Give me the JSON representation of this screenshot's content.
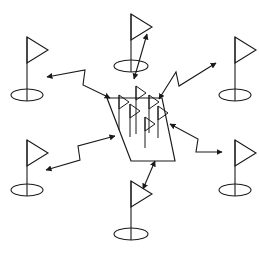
{
  "figure": {
    "title": "",
    "background_color": "#ffffff",
    "ink_color": "#1a1a1a",
    "width": 259,
    "height": 254
  },
  "central_region": {
    "name": "central-quadrilateral",
    "points": "107,98 162,98 175,161 131,161",
    "label": ""
  },
  "outer_flags": [
    {
      "id": "flag-top-left",
      "label": "",
      "pole_x": 27,
      "pole_top": 37,
      "pole_bottom": 101,
      "banner_w": 21,
      "banner_h": 13,
      "base_rx": 16,
      "base_ry": 6
    },
    {
      "id": "flag-top-center",
      "label": "",
      "pole_x": 131,
      "pole_top": 14,
      "pole_bottom": 72,
      "banner_w": 21,
      "banner_h": 13,
      "base_rx": 17,
      "base_ry": 6
    },
    {
      "id": "flag-top-right",
      "label": "",
      "pole_x": 235,
      "pole_top": 37,
      "pole_bottom": 101,
      "banner_w": 21,
      "banner_h": 13,
      "base_rx": 16,
      "base_ry": 6
    },
    {
      "id": "flag-bottom-left",
      "label": "",
      "pole_x": 27,
      "pole_top": 140,
      "pole_bottom": 196,
      "banner_w": 21,
      "banner_h": 13,
      "base_rx": 16,
      "base_ry": 6
    },
    {
      "id": "flag-bottom-center",
      "label": "",
      "pole_x": 131,
      "pole_top": 181,
      "pole_bottom": 240,
      "banner_w": 21,
      "banner_h": 13,
      "base_rx": 17,
      "base_ry": 6
    },
    {
      "id": "flag-bottom-right",
      "label": "",
      "pole_x": 235,
      "pole_top": 140,
      "pole_bottom": 196,
      "banner_w": 21,
      "banner_h": 13,
      "base_rx": 16,
      "base_ry": 6
    }
  ],
  "inner_flags": [
    {
      "id": "inner-flag-1",
      "pole_x": 119,
      "pole_top": 95,
      "pole_bottom": 130,
      "banner_w": 10,
      "banner_h": 7
    },
    {
      "id": "inner-flag-2",
      "pole_x": 136,
      "pole_top": 86,
      "pole_bottom": 134,
      "banner_w": 10,
      "banner_h": 7
    },
    {
      "id": "inner-flag-3",
      "pole_x": 130,
      "pole_top": 104,
      "pole_bottom": 137,
      "banner_w": 10,
      "banner_h": 7
    },
    {
      "id": "inner-flag-4",
      "pole_x": 149,
      "pole_top": 95,
      "pole_bottom": 133,
      "banner_w": 10,
      "banner_h": 7
    },
    {
      "id": "inner-flag-5",
      "pole_x": 145,
      "pole_top": 117,
      "pole_bottom": 148,
      "banner_w": 10,
      "banner_h": 7
    },
    {
      "id": "inner-flag-6",
      "pole_x": 158,
      "pole_top": 106,
      "pole_bottom": 138,
      "banner_w": 10,
      "banner_h": 7
    }
  ],
  "connectors": [
    {
      "id": "connector-top-left",
      "shape": "zigzag",
      "arrowheads": "both",
      "path": "47,77 85,70 83,85 110,98"
    },
    {
      "id": "connector-top-center",
      "shape": "straight",
      "arrowheads": "both",
      "path": "134,79 147,34"
    },
    {
      "id": "connector-top-right",
      "shape": "zigzag",
      "arrowheads": "both",
      "path": "159,99 176,72 179,86 216,63"
    },
    {
      "id": "connector-bottom-left",
      "shape": "zigzag",
      "arrowheads": "both",
      "path": "115,136 78,146 80,160 46,170"
    },
    {
      "id": "connector-bottom-center",
      "shape": "straight",
      "arrowheads": "both",
      "path": "155,161 143,189"
    },
    {
      "id": "connector-bottom-right",
      "shape": "zigzag",
      "arrowheads": "both",
      "path": "170,124 198,139 196,152 222,152"
    }
  ],
  "counts": {
    "outer_flags": 6,
    "inner_flags": 6,
    "connectors": 6
  }
}
